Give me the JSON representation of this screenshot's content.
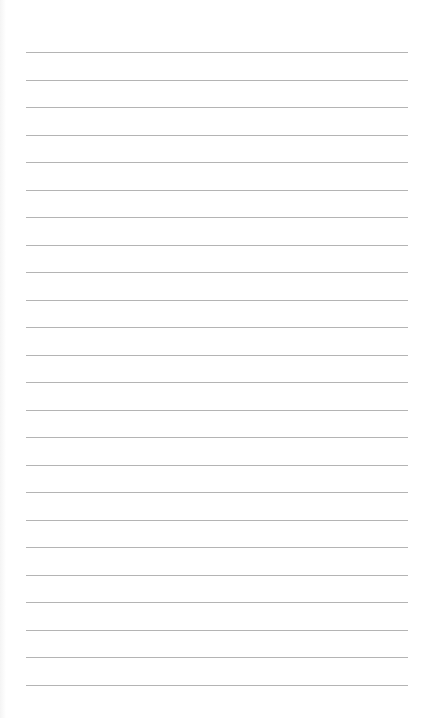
{
  "page": {
    "type": "lined-paper",
    "background_color": "#ffffff",
    "line_color": "#b4b4b4",
    "line_count": 24,
    "first_line_y": 52,
    "line_spacing": 27.5,
    "line_left": 26,
    "line_right": 408
  }
}
